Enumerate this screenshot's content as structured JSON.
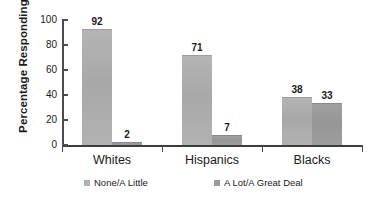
{
  "chart_data": {
    "type": "bar",
    "title": "",
    "xlabel": "",
    "ylabel": "Percentage Responding",
    "ylim": [
      0,
      100
    ],
    "yticks": [
      0,
      20,
      40,
      60,
      80,
      100
    ],
    "ytick_labels": [
      "0",
      "20",
      "40",
      "60",
      "80",
      "100"
    ],
    "grid": false,
    "legend_position": "bottom",
    "categories": [
      "Whites",
      "Hispanics",
      "Blacks"
    ],
    "series": [
      {
        "name": "None/A Little",
        "color": "#b0b0b0",
        "values": [
          92,
          71,
          38
        ],
        "labels": [
          "92",
          "71",
          "38"
        ]
      },
      {
        "name": "A Lot/A Great Deal",
        "color": "#9a9a9a",
        "values": [
          2,
          7,
          33
        ],
        "labels": [
          "2",
          "7",
          "33"
        ]
      }
    ]
  },
  "axis": {
    "y_title": "Percentage Responding"
  },
  "legend": {
    "items": [
      {
        "label": "None/A Little",
        "swatch": "series-a"
      },
      {
        "label": "A Lot/A Great Deal",
        "swatch": "series-b"
      }
    ]
  }
}
